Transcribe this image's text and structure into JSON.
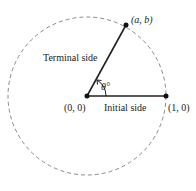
{
  "diagram": {
    "labels": {
      "point_ab": "(a, b)",
      "terminal_side": "Terminal side",
      "angle": "θ°",
      "origin": "(0, 0)",
      "initial_side": "Initial side",
      "point_10": "(1, 0)"
    },
    "colors": {
      "stroke": "#222222",
      "circle": "#777777"
    }
  }
}
